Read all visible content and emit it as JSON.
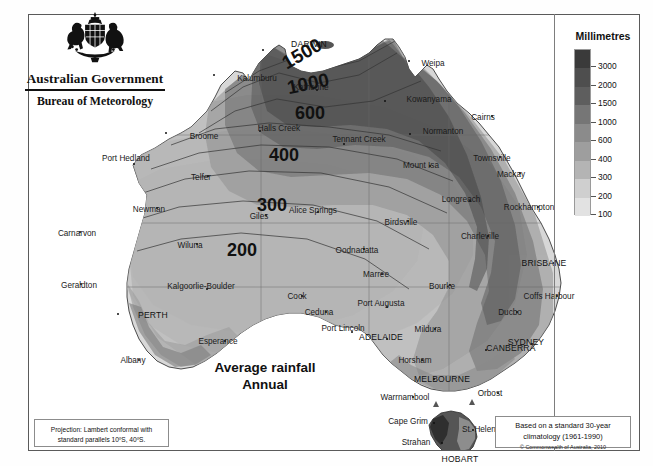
{
  "agency": {
    "crest_icon": "australian-coat-of-arms",
    "government_line": "Australian Government",
    "bureau_line": "Bureau of Meteorology"
  },
  "title": {
    "line1": "Average rainfall",
    "line2": "Annual"
  },
  "legend": {
    "header": "Millimetres",
    "units": "mm",
    "stops": [
      {
        "label": "3000",
        "color": "#3a3a3a"
      },
      {
        "label": "2000",
        "color": "#4e4e4e"
      },
      {
        "label": "1500",
        "color": "#5e5e5e"
      },
      {
        "label": "1000",
        "color": "#767676"
      },
      {
        "label": "600",
        "color": "#8b8b8b"
      },
      {
        "label": "400",
        "color": "#9e9e9e"
      },
      {
        "label": "300",
        "color": "#b4b4b4"
      },
      {
        "label": "200",
        "color": "#cfcfcf"
      },
      {
        "label": "100",
        "color": "#e2e2e2"
      }
    ]
  },
  "projection_box": {
    "line1": "Projection: Lambert conformal with",
    "line2": "standard parallels 10ºS, 40ºS."
  },
  "climatology_box": {
    "line1": "Based on a standard 30-year",
    "line2": "climatology (1961-1990)",
    "copyright": "© Commonwealth of Australia, 2010"
  },
  "chart_data": {
    "type": "map",
    "title": "Average rainfall Annual",
    "units": "Millimetres",
    "colorbar_levels": [
      100,
      200,
      300,
      400,
      600,
      1000,
      1500,
      2000,
      3000
    ],
    "contour_labels": [
      {
        "value": "1500",
        "x": 258,
        "y": 33
      },
      {
        "value": "1000",
        "x": 263,
        "y": 61
      },
      {
        "value": "600",
        "x": 271,
        "y": 92
      },
      {
        "value": "400",
        "x": 268,
        "y": 135
      },
      {
        "value": "300",
        "x": 255,
        "y": 185
      },
      {
        "value": "200",
        "x": 230,
        "y": 228
      }
    ],
    "capitals": [
      {
        "name": "DARWIN",
        "x": 233,
        "y": 34,
        "dx": 280,
        "dy": 29
      },
      {
        "name": "PERTH",
        "x": 88,
        "y": 298,
        "dx": 124,
        "dy": 300
      },
      {
        "name": "ADELAIDE",
        "x": 357,
        "y": 323,
        "dx": 352,
        "dy": 322
      },
      {
        "name": "BRISBANE",
        "x": 524,
        "y": 247,
        "dx": 515,
        "dy": 248
      },
      {
        "name": "SYDNEY",
        "x": 502,
        "y": 328,
        "dx": 497,
        "dy": 327
      },
      {
        "name": "CANBERRA",
        "x": 456,
        "y": 334,
        "dx": 482,
        "dy": 333
      },
      {
        "name": "MELBOURNE",
        "x": 404,
        "y": 363,
        "dx": 413,
        "dy": 364
      },
      {
        "name": "HOBART",
        "x": 442,
        "y": 451,
        "dx": 431,
        "dy": 444
      }
    ],
    "cities": [
      {
        "name": "Kalumburu",
        "x": 184,
        "y": 59,
        "dx": 228,
        "dy": 63
      },
      {
        "name": "Katherine",
        "x": 287,
        "y": 74,
        "dx": 282,
        "dy": 72
      },
      {
        "name": "Weipa",
        "x": 379,
        "y": 45,
        "dx": 404,
        "dy": 48
      },
      {
        "name": "Kowanyama",
        "x": 355,
        "y": 85,
        "dx": 400,
        "dy": 84
      },
      {
        "name": "Cairns",
        "x": 462,
        "y": 100,
        "dx": 454,
        "dy": 102
      },
      {
        "name": "Normanton",
        "x": 380,
        "y": 118,
        "dx": 414,
        "dy": 116
      },
      {
        "name": "Broome",
        "x": 136,
        "y": 117,
        "dx": 175,
        "dy": 121
      },
      {
        "name": "Halls Creek",
        "x": 230,
        "y": 115,
        "dx": 250,
        "dy": 113
      },
      {
        "name": "Tennant Creek",
        "x": 314,
        "y": 128,
        "dx": 330,
        "dy": 124
      },
      {
        "name": "Mount Isa",
        "x": 400,
        "y": 150,
        "dx": 392,
        "dy": 150
      },
      {
        "name": "Townsville",
        "x": 470,
        "y": 141,
        "dx": 463,
        "dy": 143
      },
      {
        "name": "Mackay",
        "x": 490,
        "y": 157,
        "dx": 482,
        "dy": 159
      },
      {
        "name": "Port Hedland",
        "x": 104,
        "y": 148,
        "dx": 97,
        "dy": 143
      },
      {
        "name": "Telfer",
        "x": 178,
        "y": 160,
        "dx": 172,
        "dy": 162
      },
      {
        "name": "Longreach",
        "x": 440,
        "y": 185,
        "dx": 432,
        "dy": 184
      },
      {
        "name": "Rockhampton",
        "x": 508,
        "y": 191,
        "dx": 500,
        "dy": 192
      },
      {
        "name": "Newman",
        "x": 127,
        "y": 192,
        "dx": 120,
        "dy": 194
      },
      {
        "name": "Alice Springs",
        "x": 288,
        "y": 196,
        "dx": 284,
        "dy": 195
      },
      {
        "name": "Birdsville",
        "x": 378,
        "y": 205,
        "dx": 372,
        "dy": 207
      },
      {
        "name": "Charleville",
        "x": 458,
        "y": 220,
        "dx": 451,
        "dy": 221
      },
      {
        "name": "Giles",
        "x": 236,
        "y": 199,
        "dx": 230,
        "dy": 201
      },
      {
        "name": "Carnarvon",
        "x": 50,
        "y": 216,
        "dx": 48,
        "dy": 218
      },
      {
        "name": "Wiluna",
        "x": 167,
        "y": 228,
        "dx": 161,
        "dy": 230
      },
      {
        "name": "Oodnadatta",
        "x": 334,
        "y": 233,
        "dx": 328,
        "dy": 235
      },
      {
        "name": "Marree",
        "x": 352,
        "y": 258,
        "dx": 347,
        "dy": 259
      },
      {
        "name": "Bourke",
        "x": 420,
        "y": 269,
        "dx": 413,
        "dy": 271
      },
      {
        "name": "Geraldton",
        "x": 51,
        "y": 268,
        "dx": 50,
        "dy": 270
      },
      {
        "name": "Kalgoorlie-Boulder",
        "x": 177,
        "y": 273,
        "dx": 172,
        "dy": 271
      },
      {
        "name": "Coffs Harbour",
        "x": 527,
        "y": 280,
        "dx": 520,
        "dy": 281
      },
      {
        "name": "Cook",
        "x": 272,
        "y": 280,
        "dx": 268,
        "dy": 281
      },
      {
        "name": "Ducbo",
        "x": 487,
        "y": 296,
        "dx": 481,
        "dy": 297
      },
      {
        "name": "Ceduna",
        "x": 296,
        "y": 296,
        "dx": 290,
        "dy": 297
      },
      {
        "name": "Port Augusta",
        "x": 357,
        "y": 291,
        "dx": 352,
        "dy": 288
      },
      {
        "name": "Mildura",
        "x": 405,
        "y": 313,
        "dx": 399,
        "dy": 314
      },
      {
        "name": "Esperance",
        "x": 195,
        "y": 325,
        "dx": 189,
        "dy": 326
      },
      {
        "name": "Port Lincoln",
        "x": 322,
        "y": 316,
        "dx": 314,
        "dy": 313
      },
      {
        "name": "Albany",
        "x": 109,
        "y": 344,
        "dx": 104,
        "dy": 345
      },
      {
        "name": "Horsham",
        "x": 392,
        "y": 344,
        "dx": 386,
        "dy": 345
      },
      {
        "name": "Orbost",
        "x": 468,
        "y": 377,
        "dx": 461,
        "dy": 378
      },
      {
        "name": "Warrnambool",
        "x": 383,
        "y": 381,
        "dx": 376,
        "dy": 382
      },
      {
        "name": "Cape Grim",
        "x": 404,
        "y": 407,
        "dx": 379,
        "dy": 406
      },
      {
        "name": "St. Helens",
        "x": 443,
        "y": 414,
        "dx": 452,
        "dy": 414
      },
      {
        "name": "Strahan",
        "x": 412,
        "y": 427,
        "dx": 387,
        "dy": 427
      }
    ]
  }
}
